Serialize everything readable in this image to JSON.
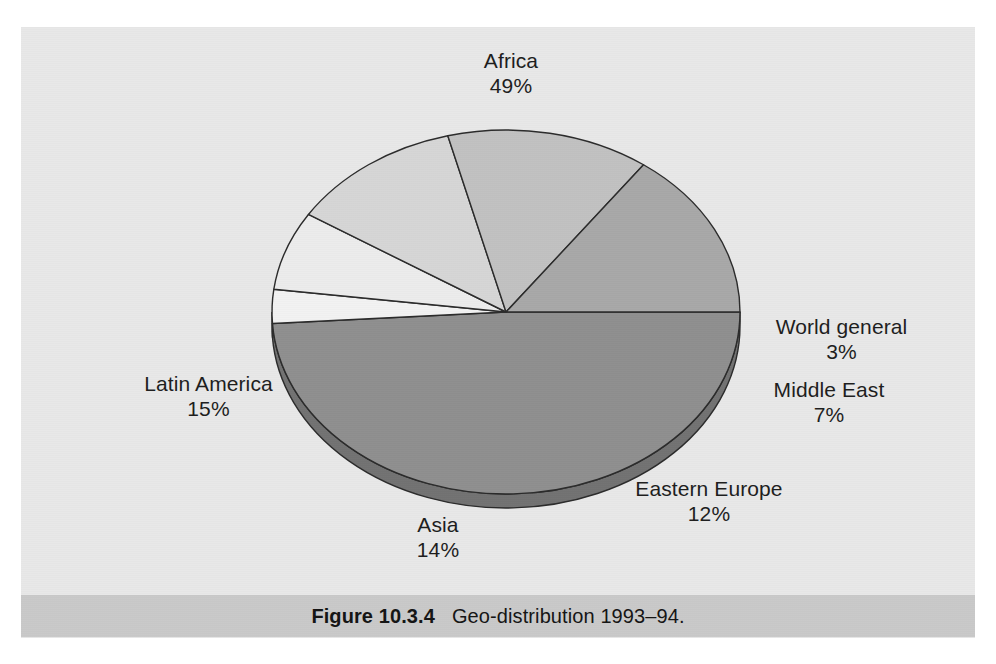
{
  "figure": {
    "caption_figure_number": "Figure 10.3.4",
    "caption_text": "Geo-distribution 1993–94."
  },
  "chart_data": {
    "type": "pie",
    "title": "Geo-distribution 1993–94",
    "xlabel": "",
    "ylabel": "",
    "legend_position": "none",
    "grid": false,
    "three_d": true,
    "rotation_start_deg": 0,
    "direction": "clockwise",
    "categories": [
      "Africa",
      "World general",
      "Middle East",
      "Eastern Europe",
      "Asia",
      "Latin America"
    ],
    "values": [
      49,
      3,
      7,
      12,
      14,
      15
    ],
    "value_unit": "%",
    "slices": [
      {
        "label": "Africa",
        "value": 49,
        "value_label": "49%",
        "color": "#8f8f8f"
      },
      {
        "label": "World general",
        "value": 3,
        "value_label": "3%",
        "color": "#f2f2f2"
      },
      {
        "label": "Middle East",
        "value": 7,
        "value_label": "7%",
        "color": "#ececec"
      },
      {
        "label": "Eastern Europe",
        "value": 12,
        "value_label": "12%",
        "color": "#d6d6d6"
      },
      {
        "label": "Asia",
        "value": 14,
        "value_label": "14%",
        "color": "#c1c1c1"
      },
      {
        "label": "Latin America",
        "value": 15,
        "value_label": "15%",
        "color": "#a8a8a8"
      }
    ]
  },
  "labels": {
    "africa": {
      "name": "Africa",
      "pct": "49%"
    },
    "world_general": {
      "name": "World general",
      "pct": "3%"
    },
    "middle_east": {
      "name": "Middle East",
      "pct": "7%"
    },
    "eastern_europe": {
      "name": "Eastern Europe",
      "pct": "12%"
    },
    "asia": {
      "name": "Asia",
      "pct": "14%"
    },
    "latin_america": {
      "name": "Latin America",
      "pct": "15%"
    }
  },
  "colors": {
    "page_background": "#ffffff",
    "panel_background": "#e8e8e8",
    "caption_bar": "#c9c9c9",
    "outline": "#2b2b2b",
    "text": "#1d1d1d"
  }
}
